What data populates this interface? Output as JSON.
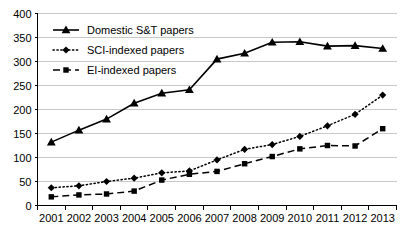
{
  "chart_data": {
    "type": "line",
    "title": "",
    "xlabel": "",
    "ylabel": "",
    "categories": [
      "2001",
      "2002",
      "2003",
      "2004",
      "2005",
      "2006",
      "2007",
      "2008",
      "2009",
      "2010",
      "2011",
      "2012",
      "2013"
    ],
    "ylim": [
      0,
      400
    ],
    "ytick_values": [
      0,
      50,
      100,
      150,
      200,
      250,
      300,
      350,
      400
    ],
    "ytick_labels": [
      "0",
      "50",
      "100",
      "150",
      "200",
      "250",
      "300",
      "350",
      "400"
    ],
    "grid": true,
    "legend_position": "top-left",
    "series": [
      {
        "name": "Domestic S&T papers",
        "marker": "triangle",
        "line_style": "solid",
        "values": [
          132,
          157,
          180,
          213,
          234,
          241,
          305,
          317,
          340,
          341,
          332,
          333,
          327
        ]
      },
      {
        "name": "SCI-indexed papers",
        "marker": "diamond",
        "line_style": "dotted",
        "values": [
          37,
          41,
          50,
          57,
          68,
          72,
          95,
          117,
          127,
          144,
          166,
          190,
          230
        ]
      },
      {
        "name": "EI-indexed papers",
        "marker": "square",
        "line_style": "dashed",
        "values": [
          18,
          22,
          24,
          30,
          53,
          65,
          71,
          87,
          102,
          118,
          125,
          124,
          160
        ]
      }
    ]
  }
}
